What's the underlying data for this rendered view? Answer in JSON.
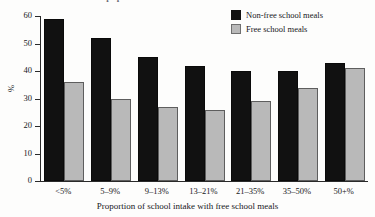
{
  "figure": {
    "partial_title": "of pupils",
    "background_color": "#fdfdfc"
  },
  "legend": {
    "items": [
      {
        "label": "Non-free school meals",
        "color": "#111111",
        "swatch": "dark"
      },
      {
        "label": "Free school meals",
        "color": "#b9b9b9",
        "swatch": "light"
      }
    ]
  },
  "axes": {
    "y": {
      "label": "%",
      "ticks": [
        0,
        10,
        20,
        30,
        40,
        50,
        60
      ],
      "min": 0,
      "max": 60
    },
    "x": {
      "label": "Proportion of school intake with free school meals"
    }
  },
  "chart_data": {
    "type": "bar",
    "title": "",
    "xlabel": "Proportion of school intake with free school meals",
    "ylabel": "%",
    "ylim": [
      0,
      60
    ],
    "yticks": [
      0,
      10,
      20,
      30,
      40,
      50,
      60
    ],
    "grid": false,
    "legend_position": "top-right",
    "categories": [
      "<5%",
      "5–9%",
      "9–13%",
      "13–21%",
      "21–35%",
      "35–50%",
      "50+%"
    ],
    "series": [
      {
        "name": "Non-free school meals",
        "color": "#111111",
        "values": [
          59,
          52,
          45,
          42,
          40,
          40,
          43
        ]
      },
      {
        "name": "Free school meals",
        "color": "#b9b9b9",
        "values": [
          36,
          30,
          27,
          26,
          29,
          34,
          41
        ]
      }
    ]
  }
}
